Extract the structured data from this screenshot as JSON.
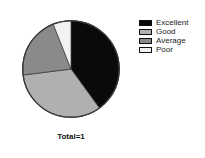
{
  "chart_data": {
    "type": "pie",
    "title": "",
    "categories": [
      "Excellent",
      "Good",
      "Average",
      "Poor"
    ],
    "values": [
      40,
      33,
      21,
      6
    ],
    "units": "percent",
    "start_angle_deg": 0,
    "direction": "clockwise",
    "colors": [
      "#0a0a0a",
      "#b0b0b0",
      "#8a8a8a",
      "#f2f2f2"
    ],
    "slice_border_color": "#333333",
    "legend_position": "right",
    "grid": false,
    "annotations": [
      "Total=1"
    ]
  },
  "legend": {
    "items": [
      {
        "label": "Excellent",
        "color": "#0a0a0a"
      },
      {
        "label": "Good",
        "color": "#b0b0b0"
      },
      {
        "label": "Average",
        "color": "#8a8a8a"
      },
      {
        "label": "Poor",
        "color": "#f2f2f2"
      }
    ]
  },
  "footer": {
    "total_label": "Total=1"
  }
}
